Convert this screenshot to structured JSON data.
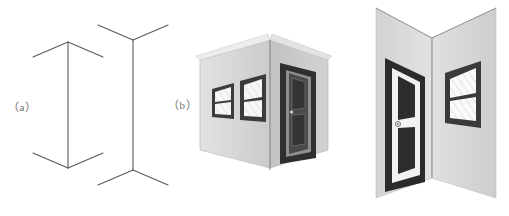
{
  "figure": {
    "background_color": "#ffffff",
    "width": 509,
    "height": 216,
    "labels": [
      {
        "id": "a",
        "text": "（a）",
        "x": 8,
        "y": 98
      },
      {
        "id": "b",
        "text": "（b）",
        "x": 168,
        "y": 96
      }
    ],
    "panel_a": {
      "name": "muller-lyer-line-drawings",
      "line_color": "#5a5a5a",
      "line_width": 1.1,
      "figures": [
        {
          "name": "arrowheads-inward-figure",
          "description": "vertical shaft with fins angled outward-downward at top and outward-upward at bottom, forming arrow heads pointing away from shaft ends",
          "shaft": {
            "x": 68,
            "y_top": 42,
            "y_bottom": 168
          },
          "fins": [
            {
              "from_x": 68,
              "from_y": 42,
              "to_x": 33,
              "to_y": 57
            },
            {
              "from_x": 68,
              "from_y": 42,
              "to_x": 103,
              "to_y": 57
            },
            {
              "from_x": 68,
              "from_y": 168,
              "to_x": 33,
              "to_y": 153
            },
            {
              "from_x": 68,
              "from_y": 168,
              "to_x": 103,
              "to_y": 153
            }
          ],
          "perceived_length": "shorter"
        },
        {
          "name": "arrowheads-outward-figure",
          "description": "vertical shaft with fins forming feather tails, opening away from the shaft at both ends",
          "shaft": {
            "x": 133,
            "y_top": 40,
            "y_bottom": 170
          },
          "fins": [
            {
              "from_x": 133,
              "from_y": 40,
              "to_x": 98,
              "to_y": 25
            },
            {
              "from_x": 133,
              "from_y": 40,
              "to_x": 168,
              "to_y": 25
            },
            {
              "from_x": 133,
              "from_y": 170,
              "to_x": 98,
              "to_y": 185
            },
            {
              "from_x": 133,
              "from_y": 170,
              "to_x": 168,
              "to_y": 185
            }
          ],
          "perceived_length": "longer"
        }
      ]
    },
    "panel_b": {
      "name": "three-dimensional-corner-scenes",
      "scenes": [
        {
          "name": "convex-corner-scene",
          "description": "outside building corner viewed from outside, two grey walls meeting at a near vertical edge",
          "corner_type": "convex",
          "wall_color_left": "#d6d6d4",
          "wall_color_right": "#bdbdbb",
          "edge_color": "#8c8c8a",
          "elements": [
            {
              "type": "window",
              "name": "window-small-left",
              "panes": 2
            },
            {
              "type": "window",
              "name": "window-large-left",
              "panes": 2
            },
            {
              "type": "door",
              "name": "door-right-wall",
              "panels": 2,
              "frame": "dark"
            }
          ]
        },
        {
          "name": "concave-corner-scene",
          "description": "inside room corner viewed from within, two grey walls receding to a far vertical edge",
          "corner_type": "concave",
          "wall_color_left": "#d9d9d7",
          "wall_color_right": "#cfcfcd",
          "edge_color": "#8c8c8a",
          "elements": [
            {
              "type": "door",
              "name": "door-left-wall",
              "panels": 2,
              "frame": "dark",
              "has_knob": true
            },
            {
              "type": "window",
              "name": "window-right-wall",
              "panes": 2
            }
          ]
        }
      ]
    },
    "colors": {
      "line": "#5a5a5a",
      "label_text": "#6e6e6e",
      "wall_light": "#dcdcda",
      "wall_mid": "#cacac8",
      "wall_dark": "#b6b6b4",
      "frame_dark": "#3d3d3d",
      "frame_darker": "#2b2b2b",
      "pane_white": "#f7f7f7",
      "trim_white": "#efefed",
      "hatch": "#9a9a9a",
      "edge": "#8c8c8a"
    }
  }
}
